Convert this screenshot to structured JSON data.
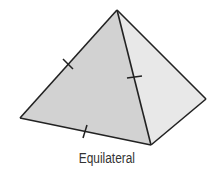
{
  "figure": {
    "shape": "square pyramid",
    "caption": "Equilateral",
    "colors": {
      "left_face": "#d2d2d2",
      "right_face": "#e8e8e8",
      "edge": "#222222",
      "caption": "#333333"
    },
    "tick_marks": 3
  }
}
